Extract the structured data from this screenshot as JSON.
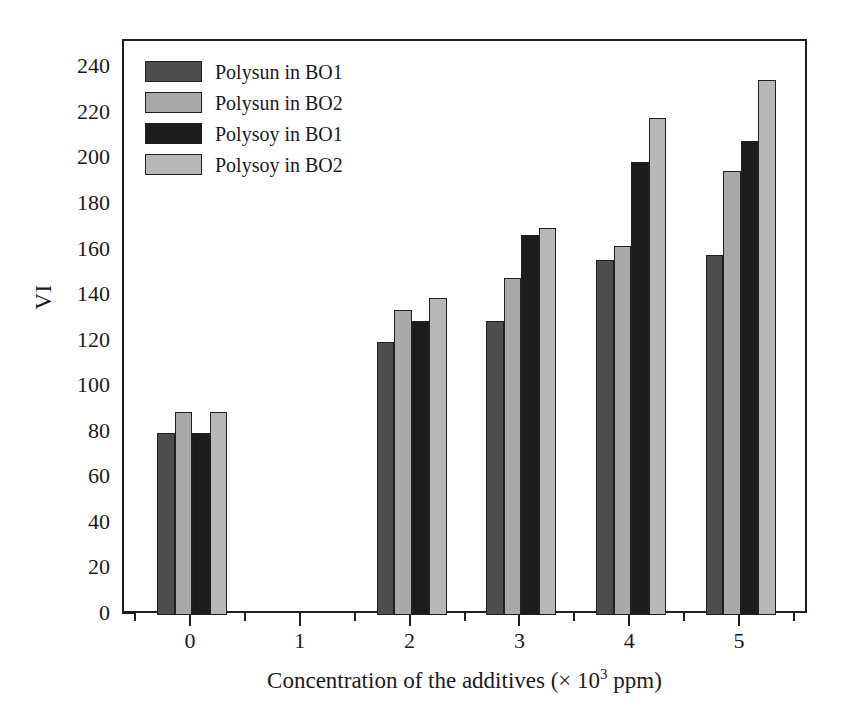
{
  "chart_data": {
    "type": "bar",
    "title": "",
    "xlabel": "Concentration of the additives (× 10³ ppm)",
    "ylabel": "VI",
    "categories": [
      "0",
      "1",
      "2",
      "3",
      "4",
      "5"
    ],
    "xlim": [
      -0.62,
      5.62
    ],
    "ylim": [
      0,
      252
    ],
    "ytick_labels": [
      "0",
      "20",
      "40",
      "60",
      "80",
      "100",
      "120",
      "140",
      "160",
      "180",
      "200",
      "220",
      "240"
    ],
    "ytick_values": [
      0,
      20,
      40,
      60,
      80,
      100,
      120,
      140,
      160,
      180,
      200,
      220,
      240
    ],
    "yminor_step": 10,
    "xtick_labels": [
      "0",
      "1",
      "2",
      "3",
      "4",
      "5"
    ],
    "xtick_values": [
      0,
      1,
      2,
      3,
      4,
      5
    ],
    "xminor_step": 0.5,
    "grid": false,
    "legend_position": "top-left",
    "series": [
      {
        "name": "Polysun in BO1",
        "color": "#4d4d4d",
        "values": [
          80,
          null,
          120,
          129,
          156,
          158
        ]
      },
      {
        "name": "Polysun in BO2",
        "color": "#a9a9a9",
        "values": [
          89,
          null,
          134,
          148,
          162,
          195
        ]
      },
      {
        "name": "Polysoy in BO1",
        "color": "#1c1c1c",
        "values": [
          80,
          null,
          129,
          167,
          199,
          208
        ]
      },
      {
        "name": "Polysoy in BO2",
        "color": "#b8b8b8",
        "values": [
          89,
          null,
          139,
          170,
          218,
          235
        ]
      }
    ]
  },
  "axes": {
    "y_title": "VI",
    "x_title_main": "Concentration of the additives (× 10",
    "x_title_sup": "3",
    "x_title_tail": " ppm)"
  },
  "colors": {
    "axis": "#231f20",
    "background": "#ffffff",
    "series1": "#4d4d4d",
    "series2": "#a9a9a9",
    "series3": "#1c1c1c",
    "series4": "#b8b8b8"
  }
}
